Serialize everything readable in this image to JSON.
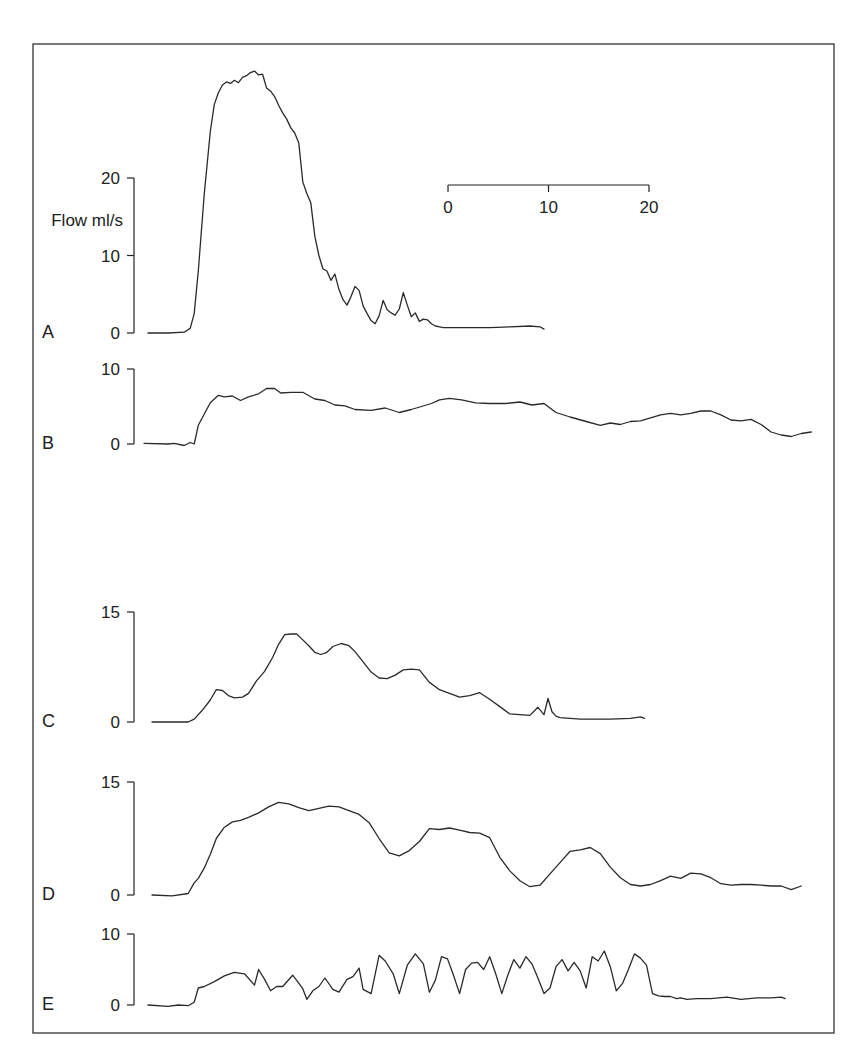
{
  "chart_data": {
    "type": "line",
    "title": "",
    "ylabel": "Flow ml/s",
    "xlabel": "",
    "time_scale_bar": {
      "ticks": [
        "0",
        "10",
        "20"
      ],
      "values": [
        0,
        10,
        20
      ],
      "px_per_unit": 10.05,
      "x0_px": 448,
      "y_px": 185
    },
    "trace_origin_px": 148,
    "panels": [
      {
        "label": "A",
        "y_ticks": [
          0,
          10,
          20
        ],
        "y_tick_labels": [
          "0",
          "10",
          "20"
        ],
        "y_axis_px": {
          "x": 134,
          "zero": 333,
          "top_value": 20,
          "top": 178
        },
        "show_ylabel": true,
        "series": {
          "name": "A",
          "x": [
            0,
            2,
            3.6,
            4.2,
            4.6,
            5.0,
            5.6,
            6.2,
            6.6,
            7.0,
            7.4,
            7.8,
            8.2,
            8.6,
            9.0,
            9.4,
            9.8,
            10.2,
            10.6,
            11.0,
            11.4,
            11.8,
            12.2,
            12.6,
            13.0,
            13.4,
            13.8,
            14.2,
            14.6,
            15.0,
            15.4,
            15.8,
            16.2,
            16.6,
            17.0,
            17.4,
            17.8,
            18.2,
            18.6,
            19.0,
            19.4,
            19.8,
            20.2,
            20.6,
            21.0,
            21.4,
            21.8,
            22.2,
            22.6,
            23.0,
            23.4,
            23.8,
            24.2,
            24.6,
            25.0,
            25.4,
            25.8,
            26.2,
            26.6,
            27.0,
            27.4,
            27.8,
            28.2,
            28.6,
            29.0,
            29.4,
            29.8,
            30.2,
            30.6,
            31.0,
            32,
            34,
            36,
            38,
            39,
            39.4
          ],
          "values": [
            0,
            0,
            0.1,
            0.6,
            2.5,
            8,
            18,
            26,
            29.5,
            31,
            32,
            32.4,
            32.2,
            32.6,
            32.3,
            33,
            33.2,
            33.6,
            33.8,
            33.3,
            33.4,
            31.6,
            31.2,
            30.5,
            29.4,
            28.4,
            27.6,
            26.5,
            25.8,
            24.5,
            19.5,
            18,
            16.8,
            12.5,
            10,
            8.3,
            8,
            6.8,
            7.6,
            5.6,
            4.3,
            3.6,
            4.7,
            6.0,
            5.5,
            3.5,
            2.5,
            1.6,
            1.2,
            2.2,
            4.2,
            3.0,
            2.6,
            2.3,
            3.1,
            5.2,
            3.6,
            2.1,
            2.6,
            1.5,
            1.8,
            1.7,
            1.2,
            0.9,
            0.8,
            0.7,
            0.7,
            0.7,
            0.7,
            0.7,
            0.7,
            0.7,
            0.8,
            0.9,
            0.8,
            0.5
          ]
        }
      },
      {
        "label": "B",
        "y_ticks": [
          0,
          10
        ],
        "y_tick_labels": [
          "0",
          "10"
        ],
        "y_axis_px": {
          "x": 134,
          "zero": 444,
          "top_value": 10,
          "top": 369
        },
        "show_ylabel": false,
        "series": {
          "name": "B",
          "x": [
            -0.4,
            2,
            2.6,
            3.6,
            4.2,
            4.6,
            5.0,
            5.6,
            6.2,
            7.0,
            7.6,
            8.4,
            9.2,
            10.0,
            11.0,
            11.8,
            12.6,
            13.2,
            14.2,
            15.4,
            16.6,
            17.6,
            18.6,
            19.6,
            20.6,
            22.2,
            23.6,
            25.0,
            26.2,
            27.2,
            28.2,
            29.0,
            30.0,
            31.2,
            32.6,
            34.0,
            35.6,
            37.0,
            38.2,
            39.4,
            40.6,
            42.0,
            43.6,
            45.0,
            46.0,
            47.0,
            48.0,
            49.0,
            50.0,
            51.0,
            52.0,
            53.0,
            54.0,
            55.0,
            56.0,
            57.0,
            58.0,
            59.0,
            60.0,
            61.0,
            62.0,
            63.0,
            64.0,
            65.0,
            66.0
          ],
          "values": [
            0.1,
            0,
            0.1,
            -0.2,
            0.2,
            0,
            2.5,
            4,
            5.5,
            6.5,
            6.3,
            6.4,
            5.8,
            6.3,
            6.7,
            7.4,
            7.4,
            6.8,
            6.9,
            6.9,
            6.0,
            5.8,
            5.2,
            5.1,
            4.6,
            4.5,
            4.8,
            4.2,
            4.6,
            5.0,
            5.4,
            5.9,
            6.1,
            5.9,
            5.5,
            5.4,
            5.4,
            5.6,
            5.2,
            5.4,
            4.2,
            3.6,
            3.0,
            2.5,
            2.8,
            2.6,
            3.0,
            3.1,
            3.5,
            3.9,
            4.1,
            3.9,
            4.1,
            4.4,
            4.4,
            3.9,
            3.2,
            3.1,
            3.3,
            2.6,
            1.6,
            1.2,
            1.0,
            1.4,
            1.6
          ]
        }
      },
      {
        "label": "C",
        "y_ticks": [
          0,
          15
        ],
        "y_tick_labels": [
          "0",
          "15"
        ],
        "y_axis_px": {
          "x": 134,
          "zero": 722,
          "top_value": 15,
          "top": 612
        },
        "show_ylabel": false,
        "series": {
          "name": "C",
          "x": [
            0.4,
            2.4,
            4.0,
            4.6,
            5.4,
            6.2,
            6.8,
            7.4,
            8.0,
            8.6,
            9.4,
            10.0,
            10.8,
            11.6,
            12.4,
            13.0,
            13.6,
            14.2,
            14.8,
            15.4,
            16.0,
            16.6,
            17.2,
            17.8,
            18.4,
            19.2,
            20.0,
            20.6,
            21.4,
            22.2,
            23.0,
            23.8,
            24.6,
            25.4,
            26.2,
            27.0,
            28.0,
            29.0,
            30.0,
            31.0,
            32.0,
            33.0,
            34.0,
            35.0,
            36.0,
            37.0,
            38.0,
            38.8,
            39.4,
            39.8,
            40.2,
            40.6,
            41.0,
            42.0,
            43.0,
            44.0,
            46.0,
            48.0,
            49.0,
            49.4
          ],
          "values": [
            0,
            0,
            0,
            0.4,
            1.6,
            3.0,
            4.4,
            4.3,
            3.6,
            3.3,
            3.4,
            3.9,
            5.6,
            6.9,
            8.8,
            10.6,
            11.9,
            12.0,
            12.0,
            11.2,
            10.4,
            9.5,
            9.2,
            9.5,
            10.3,
            10.7,
            10.4,
            9.6,
            8.2,
            6.8,
            6.0,
            5.9,
            6.4,
            7.1,
            7.2,
            7.1,
            5.4,
            4.4,
            3.9,
            3.4,
            3.6,
            4.0,
            3.1,
            2.1,
            1.1,
            1.0,
            0.9,
            2.0,
            1.0,
            3.2,
            1.4,
            0.8,
            0.6,
            0.5,
            0.4,
            0.4,
            0.4,
            0.5,
            0.7,
            0.5
          ]
        }
      },
      {
        "label": "D",
        "y_ticks": [
          0,
          15
        ],
        "y_tick_labels": [
          "0",
          "15"
        ],
        "y_axis_px": {
          "x": 134,
          "zero": 895,
          "top_value": 15,
          "top": 782
        },
        "show_ylabel": false,
        "series": {
          "name": "D",
          "x": [
            0.4,
            2.4,
            4.0,
            4.6,
            5.0,
            5.6,
            6.2,
            6.8,
            7.6,
            8.4,
            9.2,
            10.0,
            11.0,
            12.0,
            13.0,
            14.0,
            15.0,
            16.0,
            17.0,
            18.0,
            19.0,
            20.0,
            21.0,
            22.0,
            23.0,
            24.0,
            25.0,
            26.0,
            27.0,
            28.0,
            29.0,
            30.0,
            31.0,
            32.0,
            33.0,
            34.0,
            35.0,
            36.0,
            37.0,
            38.0,
            39.0,
            40.0,
            41.0,
            42.0,
            43.0,
            44.0,
            45.0,
            46.0,
            47.0,
            48.0,
            49.0,
            50.0,
            51.0,
            52.0,
            53.0,
            54.0,
            55.0,
            56.0,
            57.0,
            58.0,
            59.0,
            60.0,
            61.0,
            62.0,
            63.0,
            64.0,
            65.0
          ],
          "values": [
            0,
            -0.1,
            0.2,
            1.6,
            2.2,
            3.6,
            5.4,
            7.5,
            9.0,
            9.7,
            9.9,
            10.3,
            10.9,
            11.7,
            12.3,
            12.1,
            11.6,
            11.2,
            11.5,
            11.8,
            11.7,
            11.2,
            10.7,
            9.6,
            7.5,
            5.6,
            5.2,
            5.9,
            7.1,
            8.8,
            8.7,
            8.9,
            8.6,
            8.3,
            8.2,
            7.6,
            5.0,
            3.2,
            1.9,
            1.1,
            1.3,
            2.8,
            4.3,
            5.8,
            6.0,
            6.3,
            5.5,
            3.7,
            2.3,
            1.4,
            1.2,
            1.4,
            1.9,
            2.5,
            2.2,
            2.9,
            2.8,
            2.3,
            1.5,
            1.3,
            1.4,
            1.4,
            1.3,
            1.2,
            1.2,
            0.7,
            1.2
          ]
        }
      },
      {
        "label": "E",
        "y_ticks": [
          0,
          10
        ],
        "y_tick_labels": [
          "0",
          "10"
        ],
        "y_axis_px": {
          "x": 134,
          "zero": 1005,
          "top_value": 10,
          "top": 934
        },
        "show_ylabel": false,
        "series": {
          "name": "E",
          "x": [
            0,
            2.0,
            3.0,
            4.0,
            4.6,
            5.0,
            5.6,
            6.6,
            7.6,
            8.6,
            9.6,
            10.6,
            11.0,
            11.6,
            12.2,
            12.8,
            13.4,
            14.4,
            15.4,
            15.8,
            16.4,
            17.0,
            17.6,
            18.4,
            19.0,
            19.8,
            20.4,
            21.0,
            21.4,
            22.2,
            23.0,
            23.6,
            24.4,
            25.0,
            25.8,
            26.6,
            27.4,
            28.0,
            28.6,
            29.2,
            29.8,
            30.4,
            31.0,
            31.6,
            32.2,
            32.8,
            33.4,
            34.0,
            34.6,
            35.2,
            35.8,
            36.4,
            37.0,
            37.6,
            38.2,
            38.8,
            39.4,
            40.0,
            40.6,
            41.2,
            41.8,
            42.4,
            43.0,
            43.6,
            44.2,
            44.8,
            45.4,
            46.0,
            46.6,
            47.2,
            47.8,
            48.4,
            49.0,
            49.6,
            50.2,
            50.8,
            51.4,
            52.0,
            52.6,
            53.0,
            53.6,
            54.6,
            56.0,
            57.6,
            59.0,
            60.6,
            62.0,
            63.0,
            63.4
          ],
          "values": [
            0,
            -0.2,
            0,
            -0.1,
            0.4,
            2.4,
            2.6,
            3.3,
            4.1,
            4.6,
            4.4,
            2.8,
            5.0,
            3.6,
            2.0,
            2.6,
            2.6,
            4.2,
            2.3,
            0.8,
            2.0,
            2.6,
            3.8,
            2.2,
            1.8,
            3.6,
            4.0,
            5.2,
            2.2,
            1.6,
            7.0,
            6.2,
            4.4,
            1.6,
            5.6,
            7.2,
            5.8,
            1.8,
            3.5,
            6.8,
            6.5,
            4.2,
            1.6,
            5.0,
            5.9,
            6.0,
            5.0,
            6.8,
            4.4,
            1.6,
            4.2,
            6.4,
            5.2,
            6.8,
            5.8,
            3.8,
            1.6,
            2.4,
            5.4,
            6.4,
            4.8,
            6.0,
            4.8,
            2.4,
            6.8,
            6.2,
            7.6,
            5.4,
            2.0,
            3.0,
            5.0,
            7.2,
            6.6,
            5.6,
            1.6,
            1.3,
            1.2,
            1.2,
            0.9,
            1.0,
            0.8,
            0.9,
            0.9,
            1.1,
            0.8,
            1.0,
            1.0,
            1.1,
            0.9
          ]
        }
      }
    ],
    "grid": false,
    "legend": "none"
  },
  "frame": {
    "x": 33,
    "y": 44,
    "width": 801,
    "height": 989
  }
}
